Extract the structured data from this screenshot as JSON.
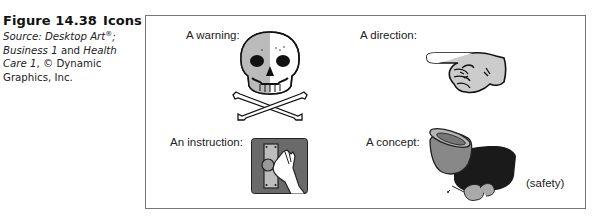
{
  "caption": {
    "figure_label": "Figure 14.38",
    "title": "Icons",
    "source_prefix": "Source: Desktop Art",
    "registered_mark": "®",
    "source_suffix": ";",
    "line2_italic": "Business 1",
    "line2_rest": " and ",
    "line2_italic2": "Health",
    "line3_italic": "Care 1",
    "line3_rest": ", © Dynamic",
    "line4": "Graphics, Inc."
  },
  "panels": [
    {
      "label": "A warning:",
      "icon": "skull-crossbones-icon"
    },
    {
      "label": "A direction:",
      "icon": "pointing-hand-icon"
    },
    {
      "label": "An instruction:",
      "icon": "hand-on-panel-icon"
    },
    {
      "label": "A concept:",
      "icon": "safety-gear-icon",
      "note": "(safety)"
    }
  ],
  "colors": {
    "frame_border": "#777777",
    "icon_dark": "#1a1a1a",
    "icon_gray": "#8a8a8a",
    "icon_light": "#d0d0d0"
  }
}
